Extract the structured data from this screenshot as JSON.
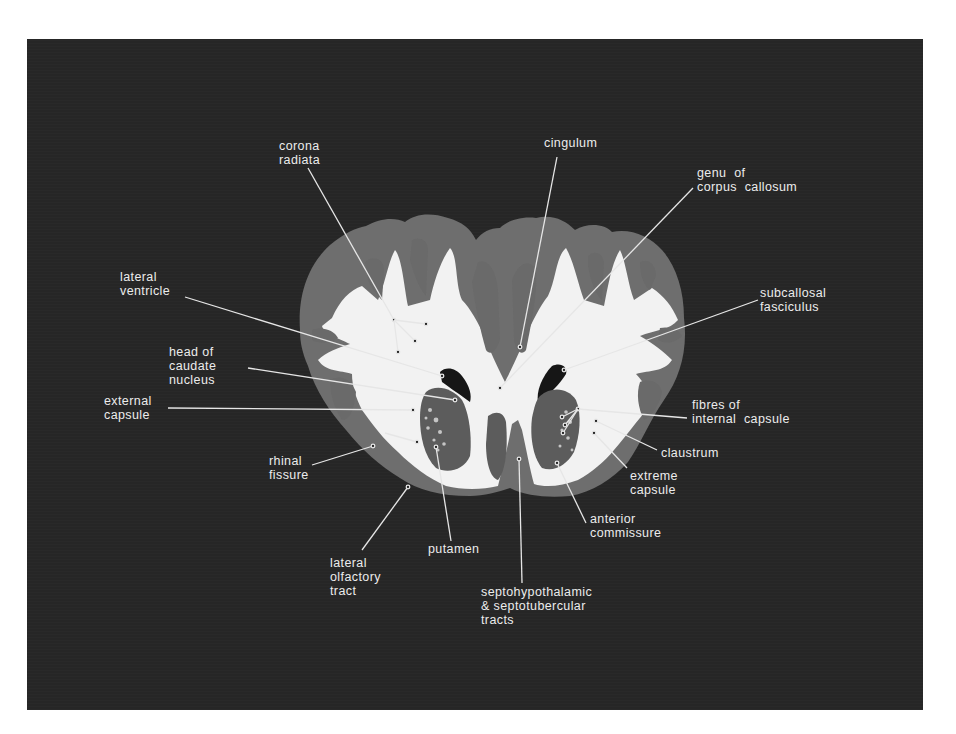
{
  "figure": {
    "background_color": "#262626",
    "label_color": "#ececec",
    "labels": [
      {
        "id": "corona-radiata",
        "text": "corona\nradiata",
        "x": 279,
        "y": 139
      },
      {
        "id": "cingulum",
        "text": "cingulum",
        "x": 544,
        "y": 136
      },
      {
        "id": "genu-of-corpus-callosum",
        "text": "genu  of\ncorpus  callosum",
        "x": 697,
        "y": 166
      },
      {
        "id": "lateral-ventricle",
        "text": "lateral\nventricle",
        "x": 120,
        "y": 270
      },
      {
        "id": "subcallosal-fasciculus",
        "text": "subcallosal\nfasciculus",
        "x": 760,
        "y": 286
      },
      {
        "id": "head-of-caudate-nucleus",
        "text": "head of\ncaudate\nnucleus",
        "x": 169,
        "y": 345
      },
      {
        "id": "external-capsule",
        "text": "external\ncapsule",
        "x": 104,
        "y": 394
      },
      {
        "id": "fibres-of-internal-capsule",
        "text": "fibres of\ninternal  capsule",
        "x": 692,
        "y": 398
      },
      {
        "id": "claustrum",
        "text": "claustrum",
        "x": 661,
        "y": 446
      },
      {
        "id": "extreme-capsule",
        "text": "extreme\ncapsule",
        "x": 630,
        "y": 469
      },
      {
        "id": "rhinal-fissure",
        "text": "rhinal\nfissure",
        "x": 269,
        "y": 454
      },
      {
        "id": "anterior-commissure",
        "text": "anterior\ncommissure",
        "x": 590,
        "y": 512
      },
      {
        "id": "putamen",
        "text": "putamen",
        "x": 428,
        "y": 542
      },
      {
        "id": "lateral-olfactory-tract",
        "text": "lateral\nolfactory\ntract",
        "x": 330,
        "y": 556
      },
      {
        "id": "septo-tracts",
        "text": "septohypothalamic\n& septotubercular\ntracts",
        "x": 481,
        "y": 585
      }
    ],
    "leaders": [
      {
        "for": "corona-radiata",
        "x1": 308,
        "y1": 168,
        "x2": 394,
        "y2": 320
      },
      {
        "for": "corona-radiata",
        "x1": 394,
        "y1": 320,
        "x2": 426,
        "y2": 324
      },
      {
        "for": "corona-radiata",
        "x1": 394,
        "y1": 320,
        "x2": 415,
        "y2": 341
      },
      {
        "for": "corona-radiata",
        "x1": 394,
        "y1": 320,
        "x2": 398,
        "y2": 352
      },
      {
        "for": "cingulum",
        "x1": 557,
        "y1": 157,
        "x2": 520,
        "y2": 347
      },
      {
        "for": "genu-of-corpus-callosum",
        "x1": 693,
        "y1": 188,
        "x2": 500,
        "y2": 388
      },
      {
        "for": "lateral-ventricle",
        "x1": 185,
        "y1": 297,
        "x2": 442,
        "y2": 376
      },
      {
        "for": "subcallosal-fasciculus",
        "x1": 758,
        "y1": 300,
        "x2": 564,
        "y2": 370
      },
      {
        "for": "head-of-caudate-nucleus",
        "x1": 248,
        "y1": 368,
        "x2": 455,
        "y2": 400
      },
      {
        "for": "external-capsule",
        "x1": 168,
        "y1": 408,
        "x2": 413,
        "y2": 410
      },
      {
        "for": "fibres-of-internal-capsule",
        "x1": 687,
        "y1": 418,
        "x2": 578,
        "y2": 409
      },
      {
        "for": "fibres-of-internal-capsule",
        "x1": 578,
        "y1": 409,
        "x2": 562,
        "y2": 417
      },
      {
        "for": "fibres-of-internal-capsule",
        "x1": 578,
        "y1": 409,
        "x2": 565,
        "y2": 425
      },
      {
        "for": "fibres-of-internal-capsule",
        "x1": 578,
        "y1": 409,
        "x2": 563,
        "y2": 433
      },
      {
        "for": "claustrum",
        "x1": 657,
        "y1": 450,
        "x2": 596,
        "y2": 421
      },
      {
        "for": "extreme-capsule",
        "x1": 627,
        "y1": 468,
        "x2": 594,
        "y2": 433
      },
      {
        "for": "rhinal-fissure",
        "x1": 312,
        "y1": 465,
        "x2": 373,
        "y2": 446
      },
      {
        "for": "rhinal-fissure",
        "x1": 385,
        "y1": 433,
        "x2": 417,
        "y2": 442
      },
      {
        "for": "anterior-commissure",
        "x1": 586,
        "y1": 523,
        "x2": 557,
        "y2": 463
      },
      {
        "for": "putamen",
        "x1": 451,
        "y1": 541,
        "x2": 436,
        "y2": 447
      },
      {
        "for": "lateral-olfactory-tract",
        "x1": 362,
        "y1": 550,
        "x2": 408,
        "y2": 487
      },
      {
        "for": "septo-tracts",
        "x1": 522,
        "y1": 583,
        "x2": 519,
        "y2": 459
      }
    ]
  }
}
